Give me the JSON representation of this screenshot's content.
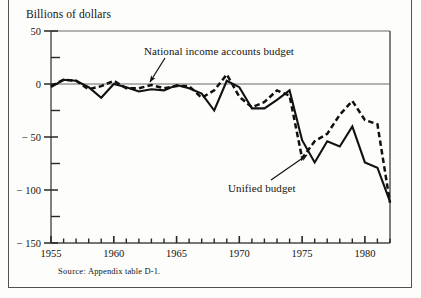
{
  "figure": {
    "units_label": "Billions of dollars",
    "source_prefix": "Source:",
    "source_text": "Appendix table D-1."
  },
  "axes": {
    "y_tick_labels": [
      "50",
      "0",
      "− 50",
      "− 100",
      "− 150"
    ],
    "y_tick_values": [
      50,
      0,
      -50,
      -100,
      -150
    ],
    "y_minor_values": [
      25,
      -25,
      -75,
      -125
    ],
    "x_tick_labels": [
      "1955",
      "1960",
      "1965",
      "1970",
      "1975",
      "1980"
    ],
    "x_tick_values": [
      1955,
      1960,
      1965,
      1970,
      1975,
      1980
    ]
  },
  "annotations": {
    "nia_label": "National income accounts budget",
    "unified_label": "Unified budget"
  },
  "chart_data": {
    "type": "line",
    "title": "",
    "subtitle": "",
    "xlabel": "",
    "ylabel": "Billions of dollars",
    "xlim": [
      1955,
      1982
    ],
    "ylim": [
      -150,
      50
    ],
    "grid": false,
    "legend_position": "inline-annotations",
    "axis_note": "Zero reference line drawn across plot at y = 0",
    "x": [
      1955,
      1956,
      1957,
      1958,
      1959,
      1960,
      1961,
      1962,
      1963,
      1964,
      1965,
      1966,
      1967,
      1968,
      1969,
      1970,
      1971,
      1972,
      1973,
      1974,
      1975,
      1976,
      1977,
      1978,
      1979,
      1980,
      1981,
      1982
    ],
    "series": [
      {
        "name": "National income accounts budget",
        "style": "dashed",
        "color": "#111111",
        "values": [
          -2,
          4,
          3,
          -5,
          -2,
          3,
          -4,
          -4,
          -1,
          -4,
          -2,
          -2,
          -13,
          -6,
          9,
          -12,
          -22,
          -17,
          -6,
          -11,
          -70,
          -54,
          -47,
          -29,
          -16,
          -34,
          -38,
          -112
        ]
      },
      {
        "name": "Unified budget",
        "style": "solid",
        "color": "#111111",
        "values": [
          -3,
          4,
          3,
          -3,
          -13,
          0,
          -3,
          -7,
          -5,
          -6,
          -1,
          -4,
          -9,
          -25,
          3,
          -3,
          -23,
          -23,
          -15,
          -6,
          -53,
          -74,
          -54,
          -59,
          -40,
          -74,
          -79,
          -111
        ]
      }
    ],
    "annotations": [
      {
        "text": "National income accounts budget",
        "target_x": 1963,
        "target_y": -3,
        "label_x": 1966.5,
        "label_y": 36
      },
      {
        "text": "Unified budget",
        "target_x": 1975.6,
        "target_y": -60,
        "label_x": 1975.5,
        "label_y": -108
      }
    ]
  }
}
